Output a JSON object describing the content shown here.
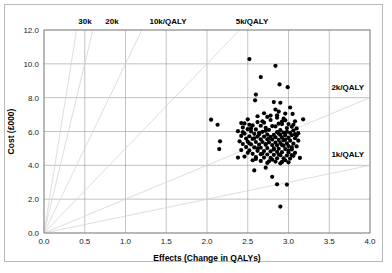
{
  "chart_data": {
    "type": "scatter",
    "title": "",
    "subtitle": "",
    "xlabel": "Effects (Change in QALYs)",
    "ylabel": "Cost (£000)",
    "xlim": [
      0.0,
      4.0
    ],
    "ylim": [
      0.0,
      12.0
    ],
    "xticks": [
      "0.0",
      "0.5",
      "1.0",
      "1.5",
      "2.0",
      "2.5",
      "3.0",
      "3.5",
      "4.0"
    ],
    "xtick_values": [
      0.0,
      0.5,
      1.0,
      1.5,
      2.0,
      2.5,
      3.0,
      3.5,
      4.0
    ],
    "yticks": [
      "0.0",
      "2.0",
      "4.0",
      "6.0",
      "8.0",
      "10.0",
      "12.0"
    ],
    "ytick_values": [
      0.0,
      2.0,
      4.0,
      6.0,
      8.0,
      10.0,
      12.0
    ],
    "grid": true,
    "legend": "none",
    "series_name": "Bootstrap replicates (cost-effectiveness plane)",
    "threshold_rays": [
      {
        "label": "30k",
        "slope_k_per_qaly": 30,
        "label_pos": "top"
      },
      {
        "label": "20k",
        "slope_k_per_qaly": 20,
        "label_pos": "top"
      },
      {
        "label": "10k/QALY",
        "slope_k_per_qaly": 10,
        "label_pos": "top"
      },
      {
        "label": "5k/QALY",
        "slope_k_per_qaly": 5,
        "label_pos": "top"
      },
      {
        "label": "2k/QALY",
        "slope_k_per_qaly": 2,
        "label_pos": "right"
      },
      {
        "label": "1k/QALY",
        "slope_k_per_qaly": 1,
        "label_pos": "right"
      }
    ],
    "points": [
      [
        2.52,
        10.28
      ],
      [
        2.84,
        9.88
      ],
      [
        2.66,
        9.22
      ],
      [
        2.89,
        8.78
      ],
      [
        2.99,
        8.62
      ],
      [
        2.6,
        8.18
      ],
      [
        2.59,
        7.84
      ],
      [
        2.82,
        7.74
      ],
      [
        2.9,
        7.7
      ],
      [
        3.02,
        7.42
      ],
      [
        2.84,
        7.3
      ],
      [
        2.88,
        7.18
      ],
      [
        3.05,
        7.04
      ],
      [
        2.74,
        6.86
      ],
      [
        2.86,
        6.82
      ],
      [
        2.94,
        6.76
      ],
      [
        2.05,
        6.7
      ],
      [
        3.18,
        6.72
      ],
      [
        2.78,
        6.68
      ],
      [
        2.96,
        6.66
      ],
      [
        3.08,
        6.6
      ],
      [
        2.62,
        6.56
      ],
      [
        2.7,
        6.52
      ],
      [
        2.42,
        6.5
      ],
      [
        2.46,
        6.48
      ],
      [
        2.88,
        6.46
      ],
      [
        2.92,
        6.44
      ],
      [
        3.0,
        6.44
      ],
      [
        2.13,
        6.4
      ],
      [
        2.52,
        6.4
      ],
      [
        2.56,
        6.36
      ],
      [
        2.66,
        6.34
      ],
      [
        2.8,
        6.32
      ],
      [
        2.84,
        6.3
      ],
      [
        3.04,
        6.28
      ],
      [
        2.44,
        6.24
      ],
      [
        2.72,
        6.22
      ],
      [
        2.98,
        6.2
      ],
      [
        3.1,
        6.18
      ],
      [
        2.5,
        6.14
      ],
      [
        2.6,
        6.12
      ],
      [
        2.76,
        6.1
      ],
      [
        2.9,
        6.08
      ],
      [
        3.06,
        6.06
      ],
      [
        2.38,
        6.02
      ],
      [
        2.54,
        6.0
      ],
      [
        2.68,
        5.98
      ],
      [
        2.86,
        5.96
      ],
      [
        2.94,
        5.94
      ],
      [
        3.02,
        5.92
      ],
      [
        3.12,
        5.9
      ],
      [
        2.46,
        5.88
      ],
      [
        2.58,
        5.86
      ],
      [
        2.64,
        5.84
      ],
      [
        2.74,
        5.82
      ],
      [
        2.82,
        5.8
      ],
      [
        2.9,
        5.8
      ],
      [
        2.96,
        5.78
      ],
      [
        3.04,
        5.78
      ],
      [
        3.1,
        5.76
      ],
      [
        2.42,
        5.74
      ],
      [
        2.52,
        5.72
      ],
      [
        2.62,
        5.7
      ],
      [
        2.7,
        5.7
      ],
      [
        2.78,
        5.68
      ],
      [
        2.84,
        5.66
      ],
      [
        2.92,
        5.64
      ],
      [
        3.0,
        5.62
      ],
      [
        3.08,
        5.6
      ],
      [
        2.48,
        5.58
      ],
      [
        2.56,
        5.56
      ],
      [
        2.66,
        5.54
      ],
      [
        2.74,
        5.54
      ],
      [
        2.8,
        5.52
      ],
      [
        2.88,
        5.5
      ],
      [
        2.94,
        5.48
      ],
      [
        3.02,
        5.46
      ],
      [
        3.12,
        5.46
      ],
      [
        2.4,
        5.42
      ],
      [
        2.5,
        5.4
      ],
      [
        2.6,
        5.38
      ],
      [
        2.68,
        5.38
      ],
      [
        2.76,
        5.36
      ],
      [
        2.84,
        5.34
      ],
      [
        2.9,
        5.32
      ],
      [
        2.98,
        5.3
      ],
      [
        3.06,
        5.28
      ],
      [
        2.44,
        5.26
      ],
      [
        2.54,
        5.24
      ],
      [
        2.64,
        5.22
      ],
      [
        2.72,
        5.22
      ],
      [
        2.8,
        5.2
      ],
      [
        2.86,
        5.18
      ],
      [
        2.94,
        5.16
      ],
      [
        3.0,
        5.14
      ],
      [
        3.1,
        5.12
      ],
      [
        2.16,
        5.42
      ],
      [
        2.48,
        5.08
      ],
      [
        2.58,
        5.06
      ],
      [
        2.66,
        5.04
      ],
      [
        2.74,
        5.02
      ],
      [
        2.82,
        5.0
      ],
      [
        2.88,
        4.98
      ],
      [
        2.96,
        4.96
      ],
      [
        3.04,
        4.94
      ],
      [
        2.15,
        4.96
      ],
      [
        2.42,
        4.9
      ],
      [
        2.52,
        4.88
      ],
      [
        2.62,
        4.86
      ],
      [
        2.7,
        4.84
      ],
      [
        2.78,
        4.82
      ],
      [
        2.86,
        4.8
      ],
      [
        2.92,
        4.78
      ],
      [
        3.0,
        4.76
      ],
      [
        3.08,
        4.74
      ],
      [
        2.56,
        4.68
      ],
      [
        2.66,
        4.66
      ],
      [
        2.74,
        4.64
      ],
      [
        2.82,
        4.62
      ],
      [
        2.9,
        4.6
      ],
      [
        2.98,
        4.58
      ],
      [
        3.06,
        4.56
      ],
      [
        2.46,
        4.52
      ],
      [
        2.6,
        4.48
      ],
      [
        2.7,
        4.46
      ],
      [
        2.78,
        4.44
      ],
      [
        2.86,
        4.42
      ],
      [
        2.94,
        4.42
      ],
      [
        3.02,
        4.4
      ],
      [
        3.14,
        4.44
      ],
      [
        2.38,
        4.46
      ],
      [
        2.56,
        4.3
      ],
      [
        2.66,
        4.26
      ],
      [
        2.76,
        4.24
      ],
      [
        2.84,
        4.22
      ],
      [
        2.92,
        4.2
      ],
      [
        3.0,
        4.18
      ],
      [
        2.58,
        3.7
      ],
      [
        2.72,
        3.86
      ],
      [
        2.8,
        3.32
      ],
      [
        2.86,
        2.88
      ],
      [
        2.98,
        2.86
      ],
      [
        2.9,
        1.56
      ],
      [
        2.62,
        6.9
      ],
      [
        2.7,
        7.08
      ],
      [
        2.78,
        6.94
      ],
      [
        2.96,
        7.06
      ],
      [
        2.86,
        6.96
      ],
      [
        2.5,
        6.72
      ],
      [
        2.68,
        6.6
      ],
      [
        2.92,
        6.58
      ],
      [
        3.06,
        6.4
      ],
      [
        2.54,
        6.18
      ],
      [
        2.72,
        6.04
      ],
      [
        2.98,
        5.98
      ],
      [
        2.44,
        5.96
      ],
      [
        2.64,
        5.92
      ],
      [
        2.88,
        5.88
      ],
      [
        3.08,
        5.84
      ],
      [
        2.58,
        5.6
      ],
      [
        2.76,
        5.58
      ],
      [
        2.96,
        5.52
      ],
      [
        2.52,
        5.3
      ],
      [
        2.72,
        5.26
      ],
      [
        2.92,
        5.2
      ],
      [
        3.04,
        5.06
      ],
      [
        2.62,
        5.0
      ],
      [
        2.82,
        4.94
      ],
      [
        3.0,
        4.88
      ],
      [
        2.5,
        4.74
      ],
      [
        2.68,
        4.7
      ],
      [
        2.88,
        4.64
      ],
      [
        3.04,
        4.6
      ],
      [
        2.6,
        4.38
      ],
      [
        2.8,
        4.34
      ],
      [
        2.96,
        4.3
      ],
      [
        2.74,
        4.14
      ],
      [
        2.9,
        4.12
      ]
    ]
  },
  "colors": {
    "point": "#000000",
    "gridline": "#9a9a9a",
    "ray": "#d4d4d4",
    "frame": "#7a7a7a",
    "outer_border": "#b9b9b9",
    "text": "#000000"
  }
}
